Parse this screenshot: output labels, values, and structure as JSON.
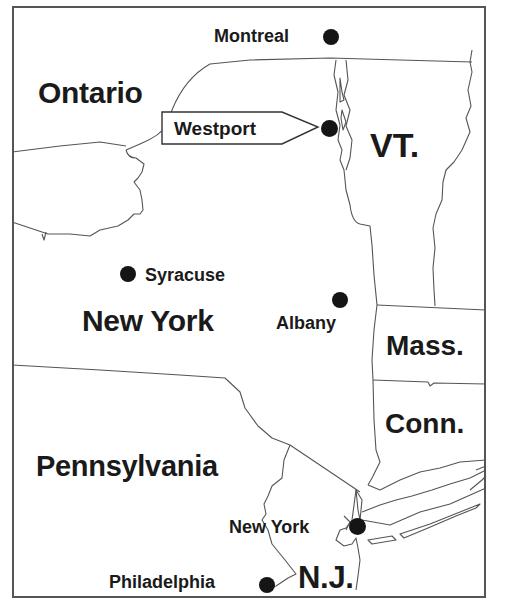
{
  "map": {
    "type": "regional reference map",
    "region": "New York and surrounding states",
    "colors": {
      "ink": "#1a1a1a",
      "border": "#555555",
      "background": "#ffffff"
    },
    "regions": [
      {
        "id": "ontario",
        "label": "Ontario"
      },
      {
        "id": "vermont",
        "label": "VT."
      },
      {
        "id": "new-york",
        "label": "New York"
      },
      {
        "id": "massachusetts",
        "label": "Mass."
      },
      {
        "id": "connecticut",
        "label": "Conn."
      },
      {
        "id": "pennsylvania",
        "label": "Pennsylvania"
      },
      {
        "id": "new-jersey",
        "label": "N.J."
      }
    ],
    "cities": [
      {
        "id": "montreal",
        "label": "Montreal"
      },
      {
        "id": "westport",
        "label": "Westport",
        "highlighted": true
      },
      {
        "id": "syracuse",
        "label": "Syracuse"
      },
      {
        "id": "albany",
        "label": "Albany"
      },
      {
        "id": "new-york-city",
        "label": "New York"
      },
      {
        "id": "philadelphia",
        "label": "Philadelphia"
      }
    ]
  }
}
